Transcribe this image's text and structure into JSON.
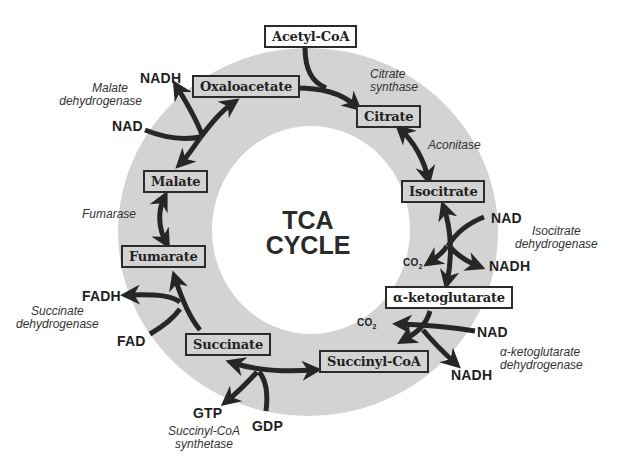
{
  "diagram": {
    "title_line1": "TCA",
    "title_line2": "CYCLE",
    "colors": {
      "ring": "#d3d3d3",
      "arrow": "#262626",
      "box_border": "#2b2b2b",
      "background": "#ffffff"
    },
    "metabolites": {
      "acetyl_coa": "Acetyl-CoA",
      "oxaloacetate": "Oxaloacetate",
      "citrate": "Citrate",
      "isocitrate": "Isocitrate",
      "alpha_ketoglutarate": "α-ketoglutarate",
      "succinyl_coa": "Succinyl-CoA",
      "succinate": "Succinate",
      "fumarate": "Fumarate",
      "malate": "Malate"
    },
    "enzymes": {
      "citrate_synthase": [
        "Citrate",
        "synthase"
      ],
      "aconitase": [
        "Aconitase"
      ],
      "isocitrate_dehydrogenase": [
        "Isocitrate",
        "dehydrogenase"
      ],
      "akg_dehydrogenase": [
        "α-ketoglutarate",
        "dehydrogenase"
      ],
      "succinyl_coa_synthetase": [
        "Succinyl-CoA",
        "synthetase"
      ],
      "succinate_dehydrogenase": [
        "Succinate",
        "dehydrogenase"
      ],
      "fumarase": [
        "Fumarase"
      ],
      "malate_dehydrogenase": [
        "Malate",
        "dehydrogenase"
      ]
    },
    "cofactors": {
      "mdh_nadh": "NADH",
      "mdh_nad": "NAD",
      "idh_nad": "NAD",
      "idh_nadh": "NADH",
      "idh_co2": "CO",
      "idh_co2_sub": "2",
      "akg_nad": "NAD",
      "akg_nadh": "NADH",
      "akg_co2": "CO",
      "akg_co2_sub": "2",
      "scs_gtp": "GTP",
      "scs_gdp": "GDP",
      "sdh_fadh": "FADH",
      "sdh_fad": "FAD"
    }
  }
}
